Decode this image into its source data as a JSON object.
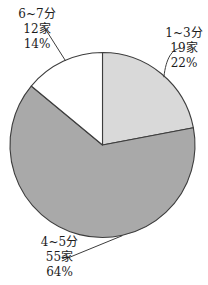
{
  "chart_data": {
    "type": "pie",
    "title": "",
    "start": "12-o-clock",
    "direction": "clockwise",
    "legend": "none",
    "stroke_color": "#3d3d3d",
    "background_color": "#ffffff",
    "slices": [
      {
        "label": "1~3分",
        "count": "19家",
        "count_value": 19,
        "percent": "22%",
        "value": 22,
        "color": "#d9d9d9"
      },
      {
        "label": "4~5分",
        "count": "55家",
        "count_value": 55,
        "percent": "64%",
        "value": 64,
        "color": "#a9a9a9"
      },
      {
        "label": "6~7分",
        "count": "12家",
        "count_value": 12,
        "percent": "14%",
        "value": 14,
        "color": "#ffffff"
      }
    ]
  }
}
